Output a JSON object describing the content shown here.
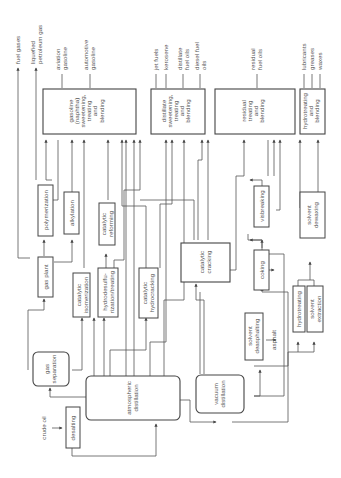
{
  "diagram": {
    "orientation": "rotated-90-ccw",
    "inputs": {
      "crude_oil": "crude oil"
    },
    "units": {
      "desalting": [
        "desalting"
      ],
      "atmospheric_distillation": [
        "atmospheric",
        "distillation"
      ],
      "vacuum_distillation": [
        "vacuum",
        "distillation"
      ],
      "gas_separation": [
        "gas",
        "separation"
      ],
      "gas_plant": [
        "gas plant"
      ],
      "polymerization": [
        "polymerization"
      ],
      "alkylation": [
        "alkylation"
      ],
      "catalytic_isomerization": [
        "catalytic",
        "isomerization"
      ],
      "catalytic_reforming": [
        "catalytic",
        "reforming"
      ],
      "hydrodesulfurization": [
        "hydrodesulfu-",
        "rization/treating"
      ],
      "catalytic_hydrocracking": [
        "catalytic",
        "hydrocracking"
      ],
      "catalytic_cracking": [
        "catalytic",
        "cracking"
      ],
      "visbreaking": [
        "visbreaking"
      ],
      "coking": [
        "coking"
      ],
      "solvent_deasphalting": [
        "solvent",
        "deasphalting"
      ],
      "hydrotreating": [
        "hydrotreating"
      ],
      "solvent_extraction": [
        "solvent",
        "extraction"
      ],
      "solvent_dewaxing": [
        "solvent",
        "dewaxing"
      ],
      "gasoline_blending": [
        "gasoline",
        "(naphtha)",
        "sweetening,",
        "treating",
        "and",
        "blending"
      ],
      "distillate_blending": [
        "distillate",
        "sweetening,",
        "treating",
        "and",
        "blending"
      ],
      "residual_blending": [
        "residual",
        "treating",
        "and",
        "blending"
      ],
      "lube_blending": [
        "hydrotreating",
        "and",
        "blending"
      ]
    },
    "byproducts": {
      "asphalt": "asphalt"
    },
    "products": {
      "fuel_gases": [
        "fuel gases"
      ],
      "lpg": [
        "liquefied",
        "petroleum gas"
      ],
      "aviation_gasoline": [
        "aviation",
        "gasoline"
      ],
      "automotive_gasoline": [
        "automotive",
        "gasoline"
      ],
      "jet_fuels": [
        "jet fuels"
      ],
      "kerosene": [
        "kerosene"
      ],
      "distillate_fuel_oils": [
        "distillate",
        "fuel oils"
      ],
      "diesel_fuel_oils": [
        "diesel fuel",
        "oils"
      ],
      "residual_fuel_oils": [
        "residual",
        "fuel oils"
      ],
      "lubricants": [
        "lubricants"
      ],
      "greases": [
        "greases"
      ],
      "waxes": [
        "waxes"
      ]
    }
  }
}
